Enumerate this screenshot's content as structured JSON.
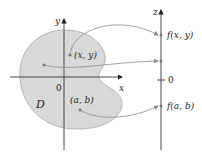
{
  "diagram": {
    "region_label": "D",
    "axes": {
      "x_label": "x",
      "y_label": "y",
      "z_label": "z",
      "origin_label": "0",
      "z_zero_label": "0"
    },
    "points": [
      {
        "label": "(x, y)",
        "maps_to": "f(x, y)"
      },
      {
        "label": "",
        "maps_to": ""
      },
      {
        "label": "(a, b)",
        "maps_to": "f(a, b)"
      }
    ],
    "colors": {
      "region_fill": "#d9d9d9",
      "region_stroke": "#a8a8a8",
      "axis": "#333333",
      "arrow": "#8a8a8a"
    }
  }
}
